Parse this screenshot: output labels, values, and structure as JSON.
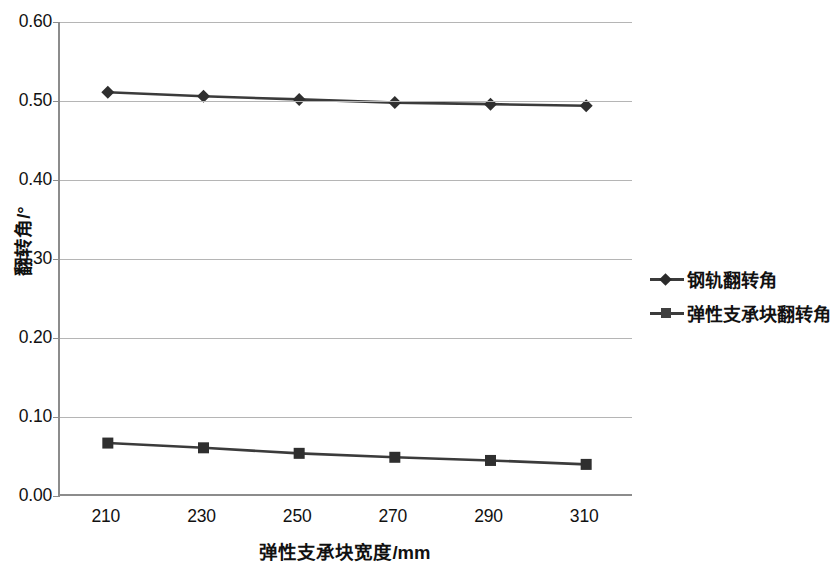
{
  "chart_data": {
    "type": "line",
    "title": "",
    "xlabel": "弹性支承块宽度/mm",
    "ylabel": "翻转角/°",
    "categories": [
      210,
      230,
      250,
      270,
      290,
      310
    ],
    "x": [
      210,
      230,
      250,
      270,
      290,
      310
    ],
    "xtick_labels": [
      "210",
      "230",
      "250",
      "270",
      "290",
      "310"
    ],
    "ytick_labels": [
      "0.60",
      "0.50",
      "0.40",
      "0.30",
      "0.20",
      "0.10",
      "0.00"
    ],
    "ytick_values": [
      0.6,
      0.5,
      0.4,
      0.3,
      0.2,
      0.1,
      0.0
    ],
    "ylim": [
      0.0,
      0.6
    ],
    "xlim": [
      200,
      320
    ],
    "grid": true,
    "legend_position": "right",
    "series": [
      {
        "name": "钢轨翻转角",
        "marker": "diamond",
        "color": "#3b3b3b",
        "values": [
          0.511,
          0.506,
          0.502,
          0.498,
          0.496,
          0.494
        ]
      },
      {
        "name": "弹性支承块翻转角",
        "marker": "square",
        "color": "#3b3b3b",
        "values": [
          0.067,
          0.061,
          0.054,
          0.049,
          0.045,
          0.04
        ]
      }
    ]
  },
  "legend": {
    "items": [
      {
        "label": "钢轨翻转角",
        "marker": "diamond"
      },
      {
        "label": "弹性支承块翻转角",
        "marker": "square"
      }
    ]
  },
  "colors": {
    "series_line": "#3b3b3b",
    "gridline": "#b5b5b5",
    "axis": "#8c8c8c",
    "text": "#111111",
    "background": "#ffffff"
  }
}
